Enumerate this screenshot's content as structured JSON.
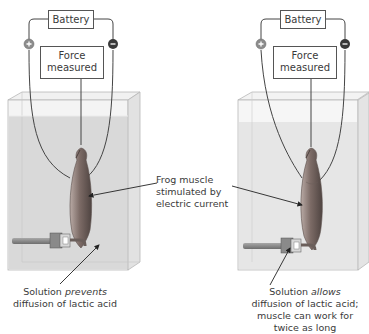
{
  "figure": {
    "left_setup": {
      "battery_label": "Battery",
      "force_label_line1": "Force",
      "force_label_line2": "measured",
      "positive_terminal": "+",
      "negative_terminal": "−",
      "caption_line1_pre": "Solution ",
      "caption_line1_em": "prevents",
      "caption_line2": "diffusion of lactic acid"
    },
    "right_setup": {
      "battery_label": "Battery",
      "force_label_line1": "Force",
      "force_label_line2": "measured",
      "positive_terminal": "+",
      "negative_terminal": "−",
      "caption_line1_pre": "Solution ",
      "caption_line1_em": "allows",
      "caption_line2": "diffusion of lactic acid;",
      "caption_line3": "muscle can work for",
      "caption_line4": "twice as long"
    },
    "center_label": {
      "line1": "Frog muscle",
      "line2": "stimulated by",
      "line3": "electric current"
    },
    "colors": {
      "solution_left": "#d9d9d9",
      "solution_right": "#e6e6e6",
      "terminal_positive": "#8c8c8c",
      "terminal_negative": "#3a3a3a",
      "muscle": "#7a6a66",
      "wire": "#444444"
    }
  }
}
